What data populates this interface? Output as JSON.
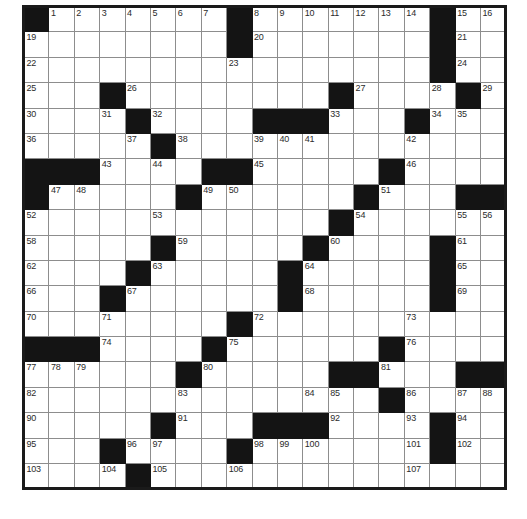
{
  "puzzle": {
    "title": "Crossword Grid",
    "rows": 19,
    "cols": 19,
    "cell_size_px": 25.4,
    "colors": {
      "block": "#141414",
      "open": "#ffffff",
      "grid_line": "#8d8d8d",
      "border": "#1a1a1a",
      "number_text": "#2b2b2b"
    },
    "grid": [
      [
        {
          "block": true
        },
        {
          "num": "1"
        },
        {
          "num": "2"
        },
        {
          "num": "3"
        },
        {
          "num": "4"
        },
        {
          "num": "5"
        },
        {
          "num": "6"
        },
        {
          "num": "7"
        },
        {
          "block": true
        },
        {
          "num": "8"
        },
        {
          "num": "9"
        },
        {
          "num": "10"
        },
        {
          "num": "11"
        },
        {
          "num": "12"
        },
        {
          "num": "13"
        },
        {
          "num": "14"
        },
        {
          "block": true
        },
        {
          "num": "15"
        },
        {
          "num": "16"
        }
      ],
      [
        {
          "num": "19"
        },
        {},
        {},
        {},
        {},
        {},
        {},
        {},
        {
          "block": true
        },
        {
          "num": "20"
        },
        {},
        {},
        {},
        {},
        {},
        {},
        {
          "block": true
        },
        {
          "num": "21"
        },
        {}
      ],
      [
        {
          "num": "22"
        },
        {},
        {},
        {},
        {},
        {},
        {},
        {},
        {
          "num": "23"
        },
        {},
        {},
        {},
        {},
        {},
        {},
        {},
        {
          "block": true
        },
        {
          "num": "24"
        },
        {}
      ],
      [
        {
          "num": "25"
        },
        {},
        {},
        {
          "block": true
        },
        {
          "num": "26"
        },
        {},
        {},
        {},
        {},
        {},
        {},
        {},
        {
          "block": true
        },
        {
          "num": "27"
        },
        {},
        {},
        {
          "num": "28"
        },
        {
          "block": true
        },
        {
          "num": "29"
        }
      ],
      [
        {
          "num": "30"
        },
        {},
        {},
        {
          "num": "31"
        },
        {
          "block": true
        },
        {
          "num": "32"
        },
        {},
        {},
        {},
        {
          "block": true
        },
        {
          "block": true
        },
        {
          "block": true
        },
        {
          "num": "33"
        },
        {},
        {},
        {
          "block": true
        },
        {
          "num": "34"
        },
        {
          "num": "35"
        },
        {}
      ],
      [
        {
          "num": "36"
        },
        {},
        {},
        {},
        {
          "num": "37"
        },
        {
          "block": true
        },
        {
          "num": "38"
        },
        {},
        {},
        {
          "num": "39"
        },
        {
          "num": "40"
        },
        {
          "num": "41"
        },
        {},
        {},
        {},
        {
          "num": "42"
        },
        {},
        {},
        {}
      ],
      [
        {
          "block": true
        },
        {
          "block": true
        },
        {
          "block": true
        },
        {
          "num": "43"
        },
        {},
        {
          "num": "44"
        },
        {},
        {
          "block": true
        },
        {
          "block": true
        },
        {
          "num": "45"
        },
        {},
        {},
        {},
        {},
        {
          "block": true
        },
        {
          "num": "46"
        },
        {},
        {},
        {}
      ],
      [
        {
          "block": true
        },
        {
          "num": "47"
        },
        {
          "num": "48"
        },
        {},
        {},
        {},
        {
          "block": true
        },
        {
          "num": "49"
        },
        {
          "num": "50"
        },
        {},
        {},
        {},
        {},
        {
          "block": true
        },
        {
          "num": "51"
        },
        {},
        {},
        {
          "block": true
        },
        {
          "block": true
        }
      ],
      [
        {
          "num": "52"
        },
        {},
        {},
        {},
        {},
        {
          "num": "53"
        },
        {},
        {},
        {},
        {},
        {},
        {},
        {
          "block": true
        },
        {
          "num": "54"
        },
        {},
        {},
        {},
        {
          "num": "55"
        },
        {
          "num": "56"
        }
      ],
      [
        {
          "num": "58"
        },
        {},
        {},
        {},
        {},
        {
          "block": true
        },
        {
          "num": "59"
        },
        {},
        {},
        {},
        {},
        {
          "block": true
        },
        {
          "num": "60"
        },
        {},
        {},
        {},
        {
          "block": true
        },
        {
          "num": "61"
        },
        {}
      ],
      [
        {
          "num": "62"
        },
        {},
        {},
        {},
        {
          "block": true
        },
        {
          "num": "63"
        },
        {},
        {},
        {},
        {},
        {
          "block": true
        },
        {
          "num": "64"
        },
        {},
        {},
        {},
        {},
        {
          "block": true
        },
        {
          "num": "65"
        },
        {}
      ],
      [
        {
          "num": "66"
        },
        {},
        {},
        {
          "block": true
        },
        {
          "num": "67"
        },
        {},
        {},
        {},
        {},
        {},
        {
          "block": true
        },
        {
          "num": "68"
        },
        {},
        {},
        {},
        {},
        {
          "block": true
        },
        {
          "num": "69"
        },
        {}
      ],
      [
        {
          "num": "70"
        },
        {},
        {},
        {
          "num": "71"
        },
        {},
        {},
        {},
        {},
        {
          "block": true
        },
        {
          "num": "72"
        },
        {},
        {},
        {},
        {},
        {},
        {
          "num": "73"
        },
        {},
        {},
        {}
      ],
      [
        {
          "block": true
        },
        {
          "block": true
        },
        {
          "block": true
        },
        {
          "num": "74"
        },
        {},
        {},
        {},
        {
          "block": true
        },
        {
          "num": "75"
        },
        {},
        {},
        {},
        {},
        {},
        {
          "block": true
        },
        {
          "num": "76"
        },
        {},
        {},
        {}
      ],
      [
        {
          "num": "77"
        },
        {
          "num": "78"
        },
        {
          "num": "79"
        },
        {},
        {},
        {},
        {
          "block": true
        },
        {
          "num": "80"
        },
        {},
        {},
        {},
        {},
        {
          "block": true
        },
        {
          "block": true
        },
        {
          "num": "81"
        },
        {},
        {},
        {
          "block": true
        },
        {
          "block": true
        }
      ],
      [
        {
          "num": "82"
        },
        {},
        {},
        {},
        {},
        {},
        {
          "num": "83"
        },
        {},
        {},
        {},
        {},
        {
          "num": "84"
        },
        {
          "num": "85"
        },
        {},
        {
          "block": true
        },
        {
          "num": "86"
        },
        {},
        {
          "num": "87"
        },
        {
          "num": "88"
        }
      ],
      [
        {
          "num": "90"
        },
        {},
        {},
        {},
        {},
        {
          "block": true
        },
        {
          "num": "91"
        },
        {},
        {},
        {
          "block": true
        },
        {
          "block": true
        },
        {
          "block": true
        },
        {
          "num": "92"
        },
        {},
        {},
        {
          "num": "93"
        },
        {
          "block": true
        },
        {
          "num": "94"
        },
        {}
      ],
      [
        {
          "num": "95"
        },
        {},
        {},
        {
          "block": true
        },
        {
          "num": "96"
        },
        {
          "num": "97"
        },
        {},
        {},
        {
          "block": true
        },
        {
          "num": "98"
        },
        {
          "num": "99"
        },
        {
          "num": "100"
        },
        {},
        {},
        {},
        {
          "num": "101"
        },
        {
          "block": true
        },
        {
          "num": "102"
        },
        {}
      ],
      [
        {
          "num": "103"
        },
        {},
        {},
        {
          "num": "104"
        },
        {
          "block": true
        },
        {
          "num": "105"
        },
        {},
        {},
        {
          "num": "106"
        },
        {},
        {},
        {},
        {},
        {},
        {},
        {
          "num": "107"
        },
        {},
        {},
        {}
      ],
      [
        {
          "num": "108"
        },
        {},
        {},
        {},
        {
          "block": true
        },
        {
          "num": "109"
        },
        {},
        {},
        {},
        {},
        {},
        {},
        {
          "block": true
        },
        {
          "num": "110"
        },
        {},
        {},
        {},
        {},
        {}
      ],
      [
        {
          "num": "111"
        },
        {},
        {},
        {},
        {
          "block": true
        },
        {
          "num": "112"
        },
        {},
        {},
        {},
        {},
        {},
        {},
        {
          "block": true
        },
        {
          "num": "113"
        },
        {},
        {},
        {},
        {},
        {
          "block": true
        }
      ]
    ]
  }
}
